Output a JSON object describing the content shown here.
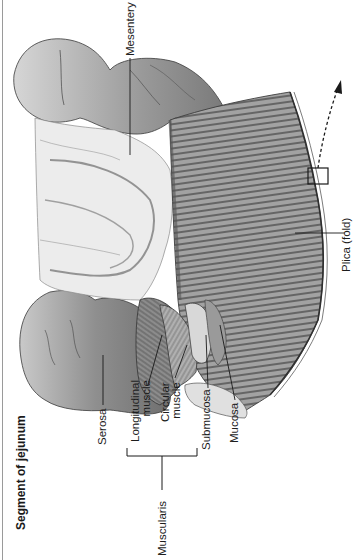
{
  "figure": {
    "title": "Segment of jejunum",
    "orientation": "rotated -90 degrees",
    "labels": {
      "serosa": "Serosa",
      "longitudinal_muscle": [
        "Longitudinal",
        "muscle"
      ],
      "circular_muscle": [
        "Circular",
        "muscle"
      ],
      "submucosa": "Submucosa",
      "mucosa": "Mucosa",
      "muscularis": "Muscularis",
      "mesentery": "Mesentery",
      "plica": "Plica (fold)"
    },
    "annotations": {
      "inset_box": "small rectangle on plica edge",
      "dashed_arrow": "curved dashed arrow pointing to enlarged view"
    },
    "colors": {
      "line": "#1a1a1a",
      "tissue_dark": "#6e6e6e",
      "tissue_mid": "#a8a8a8",
      "tissue_light": "#e2e2e2"
    }
  }
}
